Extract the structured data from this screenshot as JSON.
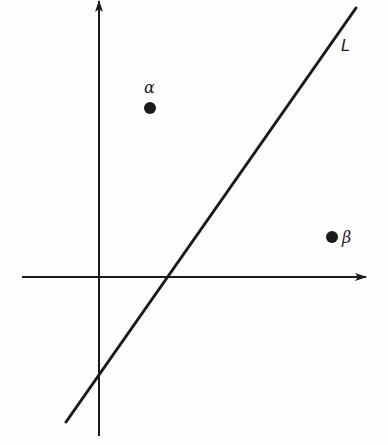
{
  "diagram": {
    "type": "coordinate-plane",
    "axes": {
      "horizontal": {
        "y": 277,
        "x_start": 22,
        "x_end": 366,
        "arrow": "right"
      },
      "vertical": {
        "x": 99,
        "y_start": 436,
        "y_end": 1,
        "arrow": "up"
      }
    },
    "line": {
      "label": "L",
      "x1": 66,
      "y1": 422,
      "x2": 356,
      "y2": 8,
      "label_pos": {
        "x": 341,
        "y": 38
      }
    },
    "points": [
      {
        "id": "alpha",
        "label": "α",
        "cx": 150,
        "cy": 108,
        "label_pos": {
          "x": 144,
          "y": 80
        }
      },
      {
        "id": "beta",
        "label": "β",
        "cx": 332,
        "cy": 237,
        "label_pos": {
          "x": 342,
          "y": 230
        }
      }
    ],
    "colors": {
      "ink": "#1a1a1a",
      "background": "#fdfdfd"
    }
  }
}
